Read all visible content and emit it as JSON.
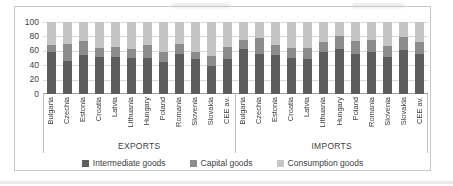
{
  "chart_data": {
    "type": "bar",
    "stacked": true,
    "title": "",
    "xlabel": "",
    "ylabel": "",
    "ylim": [
      0,
      100
    ],
    "yticks": [
      0,
      20,
      40,
      60,
      80,
      100
    ],
    "grid": true,
    "legend_position": "bottom",
    "series_names": [
      "Intermediate goods",
      "Capital goods",
      "Consumption goods"
    ],
    "groups": [
      {
        "label": "EXPORTS",
        "categories": [
          "Bulgaria",
          "Czechia",
          "Estonia",
          "Croatia",
          "Latvia",
          "Lithuania",
          "Hungary",
          "Poland",
          "Romania",
          "Slovenia",
          "Slovakia",
          "CEE av."
        ],
        "series": [
          {
            "name": "Intermediate goods",
            "values": [
              58,
              46,
              54,
              52,
              51,
              50,
              50,
              45,
              56,
              48,
              39,
              49
            ]
          },
          {
            "name": "Capital goods",
            "values": [
              10,
              24,
              19,
              12,
              14,
              12,
              18,
              14,
              13,
              11,
              14,
              16
            ]
          },
          {
            "name": "Consumption goods",
            "values": [
              32,
              30,
              27,
              36,
              35,
              38,
              32,
              41,
              31,
              41,
              47,
              35
            ]
          }
        ]
      },
      {
        "label": "IMPORTS",
        "categories": [
          "Bulgaria",
          "Czechia",
          "Estonia",
          "Croatia",
          "Latvia",
          "Lithuania",
          "Hungary",
          "Poland",
          "Romania",
          "Slovenia",
          "Slovakia",
          "CEE av."
        ],
        "series": [
          {
            "name": "Intermediate goods",
            "values": [
              62,
              55,
              54,
              50,
              48,
              58,
              62,
              56,
              59,
              52,
              61,
              55
            ]
          },
          {
            "name": "Capital goods",
            "values": [
              13,
              23,
              14,
              14,
              16,
              14,
              18,
              17,
              16,
              14,
              18,
              17
            ]
          },
          {
            "name": "Consumption goods",
            "values": [
              25,
              22,
              32,
              36,
              36,
              28,
              20,
              27,
              25,
              34,
              21,
              28
            ]
          }
        ]
      }
    ],
    "colors": {
      "intermediate": "#5d5d5d",
      "capital": "#8c8c8c",
      "consumption": "#c5c5c5",
      "gridline": "#d9d9d9",
      "axis_line": "#a6a6a6",
      "text": "#404040"
    }
  },
  "legend": {
    "items": [
      {
        "label": "Intermediate goods",
        "color": "#5d5d5d"
      },
      {
        "label": "Capital goods",
        "color": "#8c8c8c"
      },
      {
        "label": "Consumption goods",
        "color": "#c5c5c5"
      }
    ]
  }
}
